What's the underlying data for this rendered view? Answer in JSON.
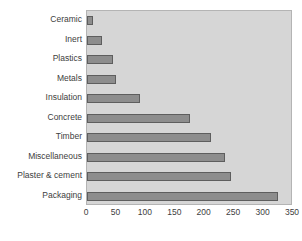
{
  "chart_data": {
    "type": "bar",
    "orientation": "horizontal",
    "title": "",
    "xlabel": "",
    "ylabel": "",
    "categories": [
      "Ceramic",
      "Inert",
      "Plastics",
      "Metals",
      "Insulation",
      "Concrete",
      "Timber",
      "Miscellaneous",
      "Plaster & cement",
      "Packaging"
    ],
    "values": [
      10,
      25,
      45,
      50,
      90,
      175,
      210,
      235,
      245,
      325
    ],
    "xticks": [
      0,
      50,
      100,
      150,
      200,
      250,
      300,
      350
    ],
    "xtick_labels": [
      "0",
      "50",
      "100",
      "150",
      "200",
      "250",
      "300",
      "350"
    ],
    "xlim": [
      0,
      350
    ],
    "grid": false,
    "legend": null,
    "series": [
      {
        "name": "",
        "values": [
          10,
          25,
          45,
          50,
          90,
          175,
          210,
          235,
          245,
          325
        ]
      }
    ]
  },
  "style": {
    "bar_fill": "#8d8d8d",
    "bar_border": "#5e5e5e",
    "plot_background": "#d6d6d6",
    "plot_border": "#b4b4b4",
    "text_color": "#404040",
    "page_background": "#ffffff"
  }
}
